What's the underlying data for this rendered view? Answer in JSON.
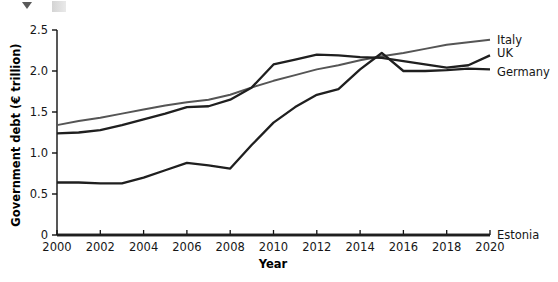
{
  "artifacts": {
    "caret_icon": "triangle-down-icon",
    "block_icon": "gray-block-icon"
  },
  "chart_data": {
    "type": "line",
    "title": "",
    "xlabel": "Year",
    "ylabel": "Government debt (€ trillion)",
    "xlim": [
      2000,
      2020
    ],
    "ylim": [
      0,
      2.5
    ],
    "xticks": [
      2000,
      2002,
      2004,
      2006,
      2008,
      2010,
      2012,
      2014,
      2016,
      2018,
      2020
    ],
    "xtick_labels": [
      "2000",
      "2002",
      "2004",
      "2006",
      "2008",
      "2010",
      "2012",
      "2014",
      "2016",
      "2018",
      "2020"
    ],
    "yticks": [
      0,
      0.5,
      1.0,
      1.5,
      2.0,
      2.5
    ],
    "ytick_labels": [
      "0",
      "0.5",
      "1.0",
      "1.5",
      "2.0",
      "2.5"
    ],
    "grid": false,
    "legend_position": "right-end-of-line",
    "x": [
      2000,
      2001,
      2002,
      2003,
      2004,
      2005,
      2006,
      2007,
      2008,
      2009,
      2010,
      2011,
      2012,
      2013,
      2014,
      2015,
      2016,
      2017,
      2018,
      2019,
      2020
    ],
    "series": [
      {
        "name": "Italy",
        "color": "#555555",
        "label_color": "#161616",
        "values": [
          1.34,
          1.39,
          1.43,
          1.48,
          1.53,
          1.58,
          1.62,
          1.65,
          1.71,
          1.8,
          1.88,
          1.95,
          2.02,
          2.07,
          2.13,
          2.18,
          2.22,
          2.27,
          2.32,
          2.35,
          2.38
        ]
      },
      {
        "name": "UK",
        "color": "#1f1f1f",
        "label_color": "#161616",
        "values": [
          1.24,
          1.25,
          1.28,
          1.34,
          1.41,
          1.48,
          1.56,
          1.57,
          1.65,
          1.8,
          2.08,
          2.14,
          2.2,
          2.19,
          2.17,
          2.16,
          2.12,
          2.08,
          2.04,
          2.07,
          2.19
        ]
      },
      {
        "name": "Germany",
        "color": "#1f1f1f",
        "label_color": "#161616",
        "values": [
          0.64,
          0.64,
          0.63,
          0.63,
          0.7,
          0.79,
          0.88,
          0.85,
          0.81,
          1.1,
          1.37,
          1.56,
          1.71,
          1.78,
          2.02,
          2.22,
          2.0,
          2.0,
          2.01,
          2.03,
          2.02
        ]
      },
      {
        "name": "Estonia",
        "color": "#1f1f1f",
        "label_color": "#161616",
        "values": [
          0.0,
          0.0,
          0.0,
          0.0,
          0.0,
          0.0,
          0.0,
          0.0,
          0.0,
          0.0,
          0.0,
          0.0,
          0.0,
          0.0,
          0.0,
          0.0,
          0.0,
          0.0,
          0.0,
          0.0,
          0.0
        ]
      }
    ]
  }
}
